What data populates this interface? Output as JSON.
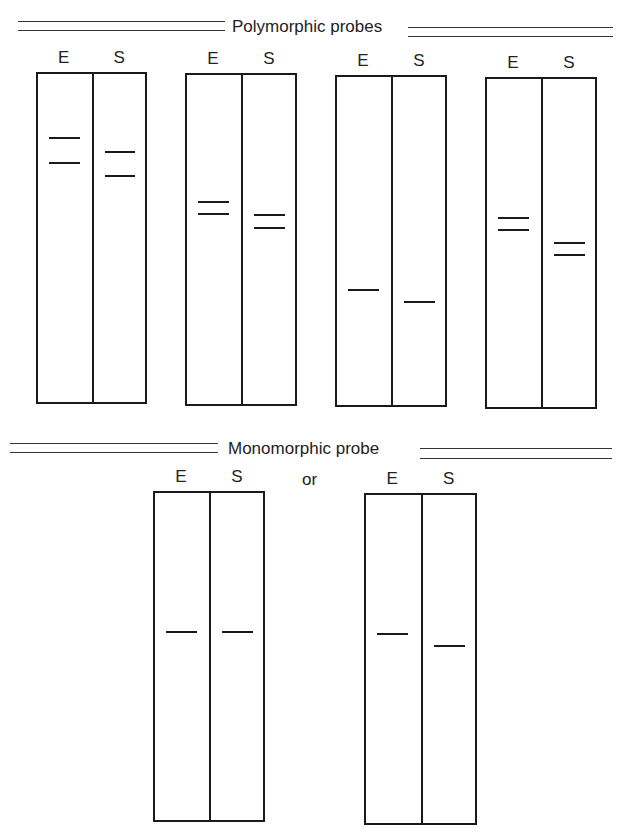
{
  "sections": {
    "polymorphic": {
      "title": "Polymorphic probes"
    },
    "monomorphic": {
      "title": "Monomorphic probe",
      "separator": "or"
    }
  },
  "lane_labels": {
    "E": "E",
    "S": "S"
  },
  "gels": [
    {
      "id": "poly-1",
      "left": 36,
      "top": 72,
      "width": 111,
      "height": 332,
      "bands": {
        "E": [
          137,
          162
        ],
        "S": [
          151,
          175
        ]
      }
    },
    {
      "id": "poly-2",
      "left": 185,
      "top": 73,
      "width": 112,
      "height": 333,
      "bands": {
        "E": [
          201,
          213
        ],
        "S": [
          214,
          227
        ]
      }
    },
    {
      "id": "poly-3",
      "left": 335,
      "top": 75,
      "width": 112,
      "height": 332,
      "bands": {
        "E": [
          289
        ],
        "S": [
          301
        ]
      }
    },
    {
      "id": "poly-4",
      "left": 485,
      "top": 77,
      "width": 112,
      "height": 332,
      "bands": {
        "E": [
          217,
          229
        ],
        "S": [
          242,
          254
        ]
      }
    },
    {
      "id": "mono-1",
      "left": 153,
      "top": 491,
      "width": 112,
      "height": 331,
      "bands": {
        "E": [
          631
        ],
        "S": [
          631
        ]
      }
    },
    {
      "id": "mono-2",
      "left": 364,
      "top": 493,
      "width": 113,
      "height": 332,
      "bands": {
        "E": [
          633
        ],
        "S": [
          645
        ]
      }
    }
  ],
  "colors": {
    "ink": "#1a1a1a",
    "background": "#ffffff"
  }
}
